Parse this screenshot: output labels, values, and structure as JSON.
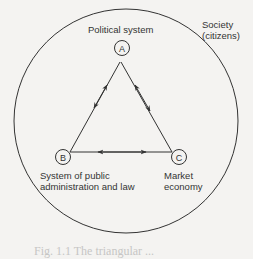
{
  "diagram": {
    "outer_label_line1": "Society",
    "outer_label_line2": "(citizens)",
    "nodes": [
      {
        "id": "A",
        "label": "Political system"
      },
      {
        "id": "B",
        "label_line1": "System of public",
        "label_line2": "administration and law"
      },
      {
        "id": "C",
        "label_line1": "Market",
        "label_line2": "economy"
      }
    ],
    "edges": [
      {
        "from": "A",
        "to": "B",
        "direction": "bidirectional"
      },
      {
        "from": "A",
        "to": "C",
        "direction": "bidirectional"
      },
      {
        "from": "B",
        "to": "C",
        "direction": "bidirectional"
      }
    ],
    "caption": "Fig. 1.1  The triangular ..."
  }
}
